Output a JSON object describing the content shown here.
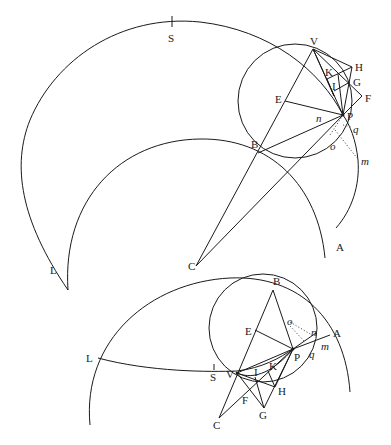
{
  "figure": {
    "upper_diagram": {
      "labels": {
        "S": "S",
        "V": "V",
        "H": "H",
        "K": "K",
        "G": "G",
        "I": "I",
        "F": "F",
        "E": "E",
        "P": "P",
        "n": "n",
        "q": "q",
        "o": "o",
        "m": "m",
        "B": "B",
        "L": "L",
        "C": "C",
        "A": "A"
      }
    },
    "lower_diagram": {
      "labels": {
        "B": "B",
        "E": "E",
        "o": "o",
        "n": "n",
        "A": "A",
        "P": "P",
        "q": "q",
        "m": "m",
        "L": "L",
        "S": "S",
        "V": "V",
        "I": "I",
        "K": "K",
        "H": "H",
        "F": "F",
        "G": "G",
        "C": "C"
      }
    }
  }
}
